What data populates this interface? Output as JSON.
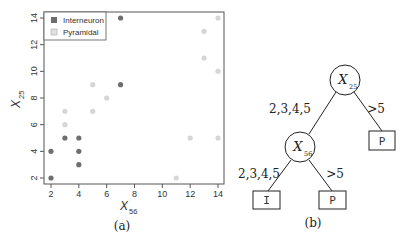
{
  "panel_a": {
    "caption": "(a)",
    "xlabel_main": "X",
    "xlabel_sub": "56",
    "ylabel_main": "X",
    "ylabel_sub": "25",
    "legend": [
      {
        "label": "Interneuron",
        "color": "#6e6e6e"
      },
      {
        "label": "Pyramidal",
        "color": "#d6d6d6"
      }
    ],
    "x_ticks": [
      "2",
      "4",
      "6",
      "8",
      "10",
      "12",
      "14"
    ],
    "y_ticks": [
      "2",
      "4",
      "6",
      "8",
      "10",
      "12",
      "14"
    ]
  },
  "panel_b": {
    "caption": "(b)",
    "root": {
      "main": "X",
      "sub": "25"
    },
    "inner": {
      "main": "X",
      "sub": "56"
    },
    "edge_root_left": "2,3,4,5",
    "edge_root_right": ">5",
    "edge_inner_left": "2,3,4,5",
    "edge_inner_right": ">5",
    "leaf_right_top": "P",
    "leaf_inner_left": "I",
    "leaf_inner_right": "P"
  },
  "chart_data": {
    "type": "scatter",
    "title": "",
    "xlabel": "X56",
    "ylabel": "X25",
    "xlim": [
      1.5,
      14.5
    ],
    "ylim": [
      1.5,
      14.5
    ],
    "x_ticks": [
      2,
      4,
      6,
      8,
      10,
      12,
      14
    ],
    "y_ticks": [
      2,
      4,
      6,
      8,
      10,
      12,
      14
    ],
    "grid": false,
    "legend_position": "top-left",
    "series": [
      {
        "name": "Interneuron",
        "color": "#6e6e6e",
        "points": [
          [
            2,
            2
          ],
          [
            2,
            4
          ],
          [
            3,
            5
          ],
          [
            4,
            5
          ],
          [
            4,
            4
          ],
          [
            4,
            3
          ],
          [
            7,
            9
          ],
          [
            7,
            14
          ]
        ]
      },
      {
        "name": "Pyramidal",
        "color": "#d6d6d6",
        "points": [
          [
            3,
            7
          ],
          [
            3,
            6
          ],
          [
            5,
            9
          ],
          [
            5,
            7
          ],
          [
            6,
            8
          ],
          [
            11,
            2
          ],
          [
            12,
            5
          ],
          [
            13,
            13
          ],
          [
            13,
            11
          ],
          [
            14,
            14
          ],
          [
            14,
            10
          ],
          [
            14,
            5
          ]
        ]
      }
    ]
  }
}
